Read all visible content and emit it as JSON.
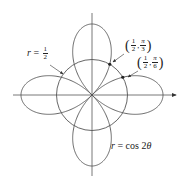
{
  "figure": {
    "type": "polar-plot",
    "center": [
      92,
      95
    ],
    "unit_px": 71,
    "axes": {
      "x_range_px": [
        13,
        176
      ],
      "y_range_px": [
        13,
        176
      ],
      "color": "#555555",
      "arrow_x": true,
      "arrow_y": false
    },
    "curves": [
      {
        "name": "rose",
        "equation": "r = cos 2θ",
        "color": "#555555"
      },
      {
        "name": "circle",
        "equation": "r = 1/2",
        "radius": 0.5,
        "color": "#555555"
      }
    ],
    "points": [
      {
        "label": "(1/2, π/3)",
        "r": 0.5,
        "theta_deg": 60
      },
      {
        "label": "(1/2, π/6)",
        "r": 0.5,
        "theta_deg": 30
      }
    ]
  },
  "labels": {
    "circle": {
      "var": "r",
      "eq": "=",
      "num": "1",
      "den": "2"
    },
    "rose": {
      "var": "r",
      "eq": "=",
      "fn": "cos 2",
      "theta": "θ"
    },
    "point_pi3": {
      "r_num": "1",
      "r_den": "2",
      "t_num": "π",
      "t_den": "3",
      "comma": ","
    },
    "point_pi6": {
      "r_num": "1",
      "r_den": "2",
      "t_num": "π",
      "t_den": "6",
      "comma": ","
    }
  }
}
